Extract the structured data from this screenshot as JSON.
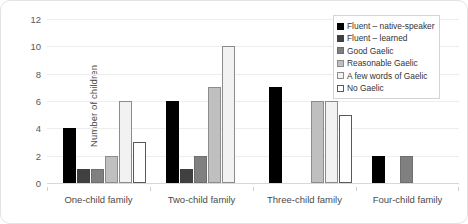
{
  "chart_data": {
    "type": "bar",
    "title": "",
    "xlabel": "",
    "ylabel": "Number of children",
    "ylim": [
      0,
      12
    ],
    "yticks": [
      0,
      2,
      4,
      6,
      8,
      10,
      12
    ],
    "grid": true,
    "legend_position": "top-right",
    "categories": [
      "One-child family",
      "Two-child family",
      "Three-child family",
      "Four-child family"
    ],
    "series": [
      {
        "name": "Fluent – native-speaker",
        "color": "#000000",
        "border": "#000000",
        "values": [
          4,
          6,
          7,
          2
        ]
      },
      {
        "name": "Fluent – learned",
        "color": "#404040",
        "border": "#404040",
        "values": [
          1,
          1,
          0,
          0
        ]
      },
      {
        "name": "Good Gaelic",
        "color": "#808080",
        "border": "#6e6e6e",
        "values": [
          1,
          2,
          0,
          2
        ]
      },
      {
        "name": "Reasonable Gaelic",
        "color": "#bfbfbf",
        "border": "#8c8c8c",
        "values": [
          2,
          7,
          6,
          0
        ]
      },
      {
        "name": "A few words of Gaelic",
        "color": "#f2f2f2",
        "border": "#8c8c8c",
        "values": [
          6,
          10,
          6,
          0
        ]
      },
      {
        "name": "No Gaelic",
        "color": "#ffffff",
        "border": "#595959",
        "values": [
          3,
          0,
          5,
          0
        ]
      }
    ]
  }
}
